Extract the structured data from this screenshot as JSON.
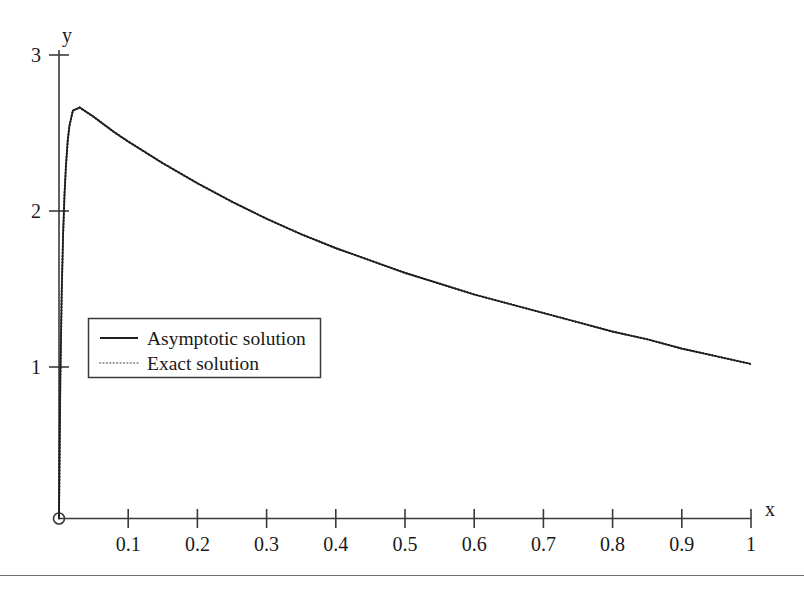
{
  "chart_data": {
    "type": "line",
    "title": "",
    "xlabel": "x",
    "ylabel": "y",
    "xlim": [
      0,
      1
    ],
    "ylim": [
      0,
      3
    ],
    "grid": false,
    "legend_position": "center-left",
    "x_ticks": [
      "0.1",
      "0.2",
      "0.3",
      "0.4",
      "0.5",
      "0.6",
      "0.7",
      "0.8",
      "0.9",
      "1"
    ],
    "x_tick_values": [
      0.1,
      0.2,
      0.3,
      0.4,
      0.5,
      0.6,
      0.7,
      0.8,
      0.9,
      1
    ],
    "y_ticks": [
      "1",
      "2",
      "3"
    ],
    "y_tick_values": [
      1,
      2,
      3
    ],
    "origin_marker": "open-circle",
    "series": [
      {
        "name": "Asymptotic solution",
        "style": "solid",
        "color": "#1f1f1f",
        "x": [
          0,
          0.002,
          0.004,
          0.006,
          0.008,
          0.01,
          0.0125,
          0.015,
          0.02,
          0.03,
          0.05,
          0.08,
          0.1,
          0.15,
          0.2,
          0.25,
          0.3,
          0.35,
          0.4,
          0.45,
          0.5,
          0.55,
          0.6,
          0.65,
          0.7,
          0.75,
          0.8,
          0.85,
          0.9,
          0.95,
          1
        ],
        "y": [
          0,
          0.92,
          1.48,
          1.85,
          2.1,
          2.28,
          2.44,
          2.54,
          2.64,
          2.66,
          2.6,
          2.5,
          2.44,
          2.3,
          2.17,
          2.05,
          1.94,
          1.84,
          1.75,
          1.67,
          1.59,
          1.52,
          1.45,
          1.39,
          1.33,
          1.27,
          1.21,
          1.16,
          1.1,
          1.05,
          1.0
        ]
      },
      {
        "name": "Exact solution",
        "style": "dotted",
        "color": "#1f1f1f",
        "x": [
          0,
          0.002,
          0.004,
          0.006,
          0.008,
          0.01,
          0.0125,
          0.015,
          0.02,
          0.03,
          0.05,
          0.08,
          0.1,
          0.15,
          0.2,
          0.25,
          0.3,
          0.35,
          0.4,
          0.45,
          0.5,
          0.55,
          0.6,
          0.65,
          0.7,
          0.75,
          0.8,
          0.85,
          0.9,
          0.95,
          1
        ],
        "y": [
          0,
          0.92,
          1.48,
          1.85,
          2.1,
          2.28,
          2.44,
          2.54,
          2.64,
          2.66,
          2.6,
          2.5,
          2.44,
          2.3,
          2.17,
          2.05,
          1.94,
          1.84,
          1.75,
          1.67,
          1.59,
          1.52,
          1.45,
          1.39,
          1.33,
          1.27,
          1.21,
          1.16,
          1.1,
          1.05,
          1.0
        ]
      }
    ],
    "legend_entries": [
      "Asymptotic solution",
      "Exact solution"
    ],
    "annotations": []
  },
  "axes": {
    "y_label": "y",
    "x_label": "x"
  },
  "legend": {
    "items": [
      {
        "label": "Asymptotic solution",
        "style": "solid"
      },
      {
        "label": "Exact solution",
        "style": "dotted"
      }
    ]
  },
  "ticks": {
    "x": [
      "0.1",
      "0.2",
      "0.3",
      "0.4",
      "0.5",
      "0.6",
      "0.7",
      "0.8",
      "0.9",
      "1"
    ],
    "y": [
      "3",
      "2",
      "1"
    ]
  },
  "colors": {
    "axis": "#3a3a3a",
    "curve": "#1f1f1f",
    "legend_border": "#3a3a3a",
    "rule": "#6e6e6e"
  }
}
